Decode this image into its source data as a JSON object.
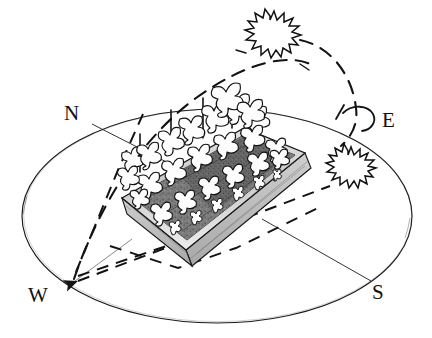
{
  "diagram": {
    "kind": "hand-drawn sketch",
    "compass": {
      "north_label": "N",
      "east_label": "E",
      "west_label": "W",
      "south_label": "S"
    },
    "elements": {
      "horizon_ellipse_name": "horizon-ellipse",
      "sun_path_name": "sun-path-arc",
      "raised_bed_name": "raised-garden-bed",
      "soil_name": "soil-surface",
      "plants_name": "leafy-plants",
      "sun_high_name": "sun-high-noon",
      "sun_low_name": "sun-low-afternoon",
      "stems_name": "plant-stems",
      "sight_lines_name": "sight-lines"
    },
    "colors": {
      "ink": "#141414",
      "paper": "#ffffff",
      "soil_dark": "#6f6f6f",
      "soil_mid": "#8c8c8c",
      "wood_light": "#d8d8d8",
      "wood_mid": "#b4b4b4",
      "plant_fill": "#fdfdfd"
    },
    "counts": {
      "suns": 2,
      "plant_rows": 3,
      "stem_markers": 4
    }
  }
}
